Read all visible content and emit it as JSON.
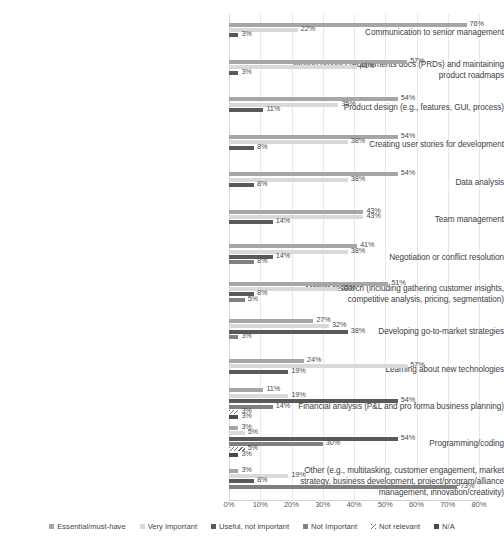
{
  "chart_data": {
    "type": "bar",
    "orientation": "horizontal",
    "title": "",
    "xlabel": "",
    "ylabel": "",
    "xlim": [
      0,
      80
    ],
    "xticks": [
      "0%",
      "10%",
      "20%",
      "30%",
      "40%",
      "50%",
      "60%",
      "70%",
      "80%"
    ],
    "xtick_values": [
      0,
      10,
      20,
      30,
      40,
      50,
      60,
      70,
      80
    ],
    "grid": true,
    "legend_position": "bottom",
    "categories": [
      "Communication to senior management",
      "Writing product requirements docs (PRDs) and maintaining product roadmaps",
      "Product design (e.g., features, GUI, process)",
      "Creating user stories for development",
      "Data analysis",
      "Team management",
      "Negotiation or conflict resolution",
      "Market research (including gathering customer insights, competitive analysis, pricing, segmentation)",
      "Developing go-to-market strategies",
      "Learning about new technologies",
      "Financial analysis (P&L and pro forma business planning)",
      "Programming/coding",
      "Other (e.g., multitasking, customer engagement, market strategy, business development, project/program/alliance management, innovation/creativity)"
    ],
    "series": [
      {
        "name": "Essential/must-have",
        "color": "#a6a6a6",
        "values": [
          76,
          57,
          54,
          54,
          54,
          43,
          41,
          51,
          27,
          24,
          11,
          3,
          3
        ]
      },
      {
        "name": "Very Important",
        "color": "#d9d9d9",
        "values": [
          22,
          41,
          35,
          38,
          38,
          43,
          38,
          35,
          32,
          57,
          19,
          3,
          19
        ]
      },
      {
        "name": "Useful, not important",
        "color": "#595959",
        "values": [
          3,
          3,
          11,
          8,
          8,
          14,
          14,
          8,
          38,
          19,
          54,
          5,
          73
        ]
      },
      {
        "name": "Not Important",
        "color": "#808080",
        "values": [
          null,
          null,
          null,
          null,
          null,
          null,
          8,
          5,
          3,
          null,
          14,
          54,
          8
        ]
      },
      {
        "name": "Not relevant",
        "color": "#6e6e6e",
        "values": [
          null,
          null,
          null,
          null,
          null,
          null,
          null,
          null,
          null,
          null,
          3,
          30,
          null
        ]
      },
      {
        "name": "N/A",
        "color": "#4a4a4a",
        "values": [
          null,
          null,
          null,
          null,
          null,
          null,
          null,
          null,
          null,
          null,
          3,
          5,
          null
        ]
      }
    ],
    "groups": [
      {
        "category": "Communication to senior management",
        "bars": [
          {
            "series": "Essential/must-have",
            "value": 76,
            "label": "76%"
          },
          {
            "series": "Very Important",
            "value": 22,
            "label": "22%"
          },
          {
            "series": "Useful, not important",
            "value": 3,
            "label": "3%"
          }
        ]
      },
      {
        "category": "Writing product requirements docs (PRDs) and maintaining product roadmaps",
        "bars": [
          {
            "series": "Essential/must-have",
            "value": 57,
            "label": "57%"
          },
          {
            "series": "Very Important",
            "value": 41,
            "label": "41%"
          },
          {
            "series": "Useful, not important",
            "value": 3,
            "label": "3%"
          }
        ]
      },
      {
        "category": "Product design (e.g., features, GUI, process)",
        "bars": [
          {
            "series": "Essential/must-have",
            "value": 54,
            "label": "54%"
          },
          {
            "series": "Very Important",
            "value": 35,
            "label": "35%"
          },
          {
            "series": "Useful, not important",
            "value": 11,
            "label": "11%"
          }
        ]
      },
      {
        "category": "Creating user stories for development",
        "bars": [
          {
            "series": "Essential/must-have",
            "value": 54,
            "label": "54%"
          },
          {
            "series": "Very Important",
            "value": 38,
            "label": "38%"
          },
          {
            "series": "Useful, not important",
            "value": 8,
            "label": "8%"
          }
        ]
      },
      {
        "category": "Data analysis",
        "bars": [
          {
            "series": "Essential/must-have",
            "value": 54,
            "label": "54%"
          },
          {
            "series": "Very Important",
            "value": 38,
            "label": "38%"
          },
          {
            "series": "Useful, not important",
            "value": 8,
            "label": "8%"
          }
        ]
      },
      {
        "category": "Team management",
        "bars": [
          {
            "series": "Essential/must-have",
            "value": 43,
            "label": "43%"
          },
          {
            "series": "Very Important",
            "value": 43,
            "label": "43%"
          },
          {
            "series": "Useful, not important",
            "value": 14,
            "label": "14%"
          }
        ]
      },
      {
        "category": "Negotiation or conflict resolution",
        "bars": [
          {
            "series": "Essential/must-have",
            "value": 41,
            "label": "41%"
          },
          {
            "series": "Very Important",
            "value": 38,
            "label": "38%"
          },
          {
            "series": "Useful, not important",
            "value": 14,
            "label": "14%"
          },
          {
            "series": "Not Important",
            "value": 8,
            "label": "8%"
          }
        ]
      },
      {
        "category": "Market research (including gathering customer insights, competitive analysis, pricing, segmentation)",
        "bars": [
          {
            "series": "Essential/must-have",
            "value": 51,
            "label": "51%"
          },
          {
            "series": "Very Important",
            "value": 35,
            "label": "35%"
          },
          {
            "series": "Useful, not important",
            "value": 8,
            "label": "8%"
          },
          {
            "series": "Not Important",
            "value": 5,
            "label": "5%"
          }
        ]
      },
      {
        "category": "Developing go-to-market strategies",
        "bars": [
          {
            "series": "Essential/must-have",
            "value": 27,
            "label": "27%"
          },
          {
            "series": "Very Important",
            "value": 32,
            "label": "32%"
          },
          {
            "series": "Useful, not important",
            "value": 38,
            "label": "38%"
          },
          {
            "series": "Not Important",
            "value": 3,
            "label": "3%"
          }
        ]
      },
      {
        "category": "Learning about new technologies",
        "bars": [
          {
            "series": "Essential/must-have",
            "value": 24,
            "label": "24%"
          },
          {
            "series": "Very Important",
            "value": 57,
            "label": "57%"
          },
          {
            "series": "Useful, not important",
            "value": 19,
            "label": "19%"
          }
        ]
      },
      {
        "category": "Financial analysis (P&L and pro forma business planning)",
        "bars": [
          {
            "series": "Essential/must-have",
            "value": 11,
            "label": "11%"
          },
          {
            "series": "Very Important",
            "value": 19,
            "label": "19%"
          },
          {
            "series": "Useful, not important",
            "value": 54,
            "label": "54%"
          },
          {
            "series": "Not Important",
            "value": 14,
            "label": "14%"
          },
          {
            "series": "Not relevant",
            "value": 3,
            "label": "3%"
          },
          {
            "series": "N/A",
            "value": 3,
            "label": "3%"
          }
        ]
      },
      {
        "category": "Programming/coding",
        "bars": [
          {
            "series": "Essential/must-have",
            "value": 3,
            "label": "3%"
          },
          {
            "series": "Very Important",
            "value": 5,
            "label": "5%"
          },
          {
            "series": "Useful, not important",
            "value": 54,
            "label": "54%"
          },
          {
            "series": "Not Important",
            "value": 30,
            "label": "30%"
          },
          {
            "series": "Not relevant",
            "value": 5,
            "label": "5%"
          },
          {
            "series": "N/A",
            "value": 3,
            "label": "3%"
          }
        ]
      },
      {
        "category": "Other (e.g., multitasking, customer engagement, market strategy, business development, project/program/alliance management, innovation/creativity)",
        "bars": [
          {
            "series": "Essential/must-have",
            "value": 3,
            "label": "3%"
          },
          {
            "series": "Very Important",
            "value": 19,
            "label": "19%"
          },
          {
            "series": "Useful, not important",
            "value": 8,
            "label": "8%"
          },
          {
            "series": "Not Important",
            "value": 73,
            "label": "73%"
          }
        ]
      }
    ]
  },
  "legend": {
    "items": [
      {
        "label": "Essential/must-have",
        "color": "#a6a6a6",
        "swatch": "square-swatch"
      },
      {
        "label": "Very Important",
        "color": "#d9d9d9",
        "swatch": "square-swatch"
      },
      {
        "label": "Useful, not important",
        "color": "#595959",
        "swatch": "square-swatch"
      },
      {
        "label": "Not Important",
        "color": "#808080",
        "swatch": "square-swatch"
      },
      {
        "label": "Not relevant",
        "color": "#6e6e6e",
        "swatch": "hatched-swatch"
      },
      {
        "label": "N/A",
        "color": "#4a4a4a",
        "swatch": "square-swatch"
      }
    ]
  }
}
